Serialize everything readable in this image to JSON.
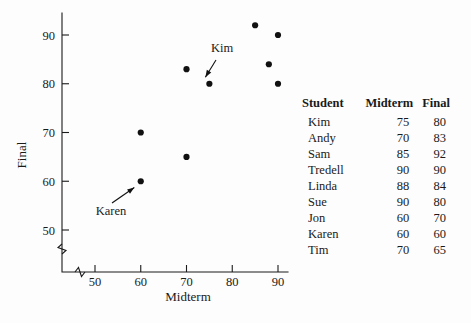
{
  "chart_data": {
    "type": "scatter",
    "title": "",
    "xlabel": "Midterm",
    "ylabel": "Final",
    "xlim": [
      45,
      92
    ],
    "ylim": [
      46,
      94
    ],
    "xticks": [
      50,
      60,
      70,
      80,
      90
    ],
    "yticks": [
      50,
      60,
      70,
      80,
      90
    ],
    "grid": false,
    "axis_break_x": true,
    "axis_break_y": true,
    "points": [
      {
        "label": "Kim",
        "x": 75,
        "y": 80
      },
      {
        "label": "Andy",
        "x": 70,
        "y": 83
      },
      {
        "label": "Sam",
        "x": 85,
        "y": 92
      },
      {
        "label": "Tredell",
        "x": 90,
        "y": 90
      },
      {
        "label": "Linda",
        "x": 88,
        "y": 84
      },
      {
        "label": "Sue",
        "x": 90,
        "y": 80
      },
      {
        "label": "Jon",
        "x": 60,
        "y": 70
      },
      {
        "label": "Karen",
        "x": 60,
        "y": 60
      },
      {
        "label": "Tim",
        "x": 70,
        "y": 65
      }
    ],
    "annotations": [
      {
        "text": "Kim",
        "x": 75,
        "y": 80
      },
      {
        "text": "Karen",
        "x": 60,
        "y": 60
      }
    ]
  },
  "table": {
    "headers": [
      "Student",
      "Midterm",
      "Final"
    ],
    "rows": [
      [
        "Kim",
        "75",
        "80"
      ],
      [
        "Andy",
        "70",
        "83"
      ],
      [
        "Sam",
        "85",
        "92"
      ],
      [
        "Tredell",
        "90",
        "90"
      ],
      [
        "Linda",
        "88",
        "84"
      ],
      [
        "Sue",
        "90",
        "80"
      ],
      [
        "Jon",
        "60",
        "70"
      ],
      [
        "Karen",
        "60",
        "60"
      ],
      [
        "Tim",
        "70",
        "65"
      ]
    ]
  },
  "colors": {
    "ink": "#111111",
    "background": "#fdfdfd"
  }
}
